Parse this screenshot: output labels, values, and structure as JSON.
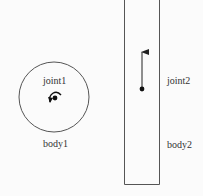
{
  "diagram": {
    "bodies": [
      {
        "id": "body1",
        "label": "body1",
        "shape": "circle"
      },
      {
        "id": "body2",
        "label": "body2",
        "shape": "rectangle"
      }
    ],
    "joints": [
      {
        "id": "joint1",
        "label": "joint1",
        "type": "revolute",
        "symbol": "rotation-arrow"
      },
      {
        "id": "joint2",
        "label": "joint2",
        "type": "prismatic",
        "symbol": "linear-arrow-up"
      }
    ],
    "colors": {
      "stroke": "#555555",
      "dot": "#111111",
      "text": "#333333",
      "background": "#fbfbfb"
    }
  }
}
